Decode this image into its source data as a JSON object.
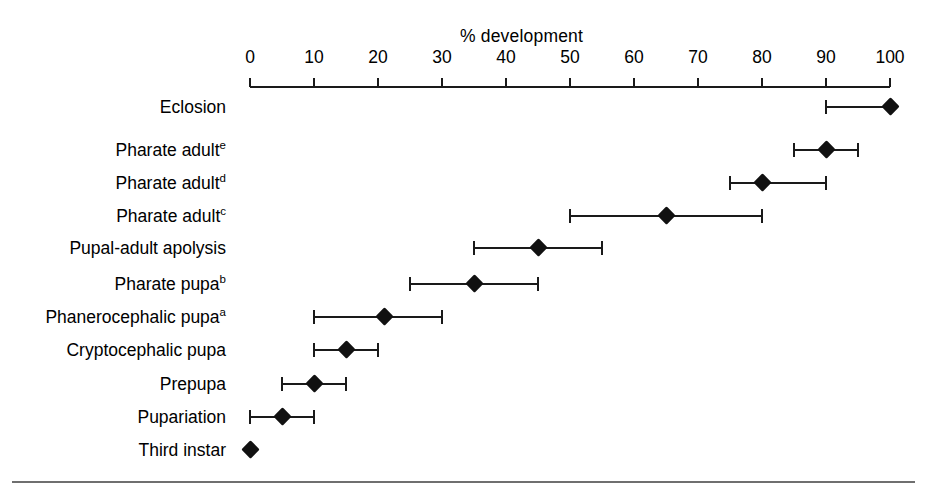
{
  "figure": {
    "background_color": "#ffffff",
    "marker_color": "#111111",
    "line_color": "#1a1a1a",
    "rule_color": "#6f6f6f"
  },
  "chart_data": {
    "type": "scatter",
    "title": "% development",
    "xlabel": "% development",
    "ylabel": "",
    "xlim": [
      0,
      100
    ],
    "xticks": [
      0,
      10,
      20,
      30,
      40,
      50,
      60,
      70,
      80,
      90,
      100
    ],
    "xticklabels": [
      "0",
      "10",
      "20",
      "30",
      "40",
      "50",
      "60",
      "70",
      "80",
      "90",
      "100"
    ],
    "grid": false,
    "legend": "none",
    "orientation": "horizontal",
    "error_bars": "horizontal range (min-max)",
    "categories": [
      "Eclosion",
      "Pharate adult e",
      "Pharate adult d",
      "Pharate adult c",
      "Pupal-adult apolysis",
      "Pharate pupa b",
      "Phanerocephalic pupa a",
      "Cryptocephalic pupa",
      "Prepupa",
      "Pupariation",
      "Third instar"
    ],
    "points": [
      {
        "label": "Eclosion",
        "label_text": "Eclosion",
        "superscript": "",
        "value": 100,
        "low": 90,
        "high": 100,
        "top": 96
      },
      {
        "label": "Pharate adult e",
        "label_text": "Pharate adult",
        "superscript": "e",
        "value": 90,
        "low": 85,
        "high": 95,
        "top": 139
      },
      {
        "label": "Pharate adult d",
        "label_text": "Pharate adult",
        "superscript": "d",
        "value": 80,
        "low": 75,
        "high": 90,
        "top": 172
      },
      {
        "label": "Pharate adult c",
        "label_text": "Pharate adult",
        "superscript": "c",
        "value": 65,
        "low": 50,
        "high": 80,
        "top": 205
      },
      {
        "label": "Pupal-adult apolysis",
        "label_text": "Pupal-adult apolysis",
        "superscript": "",
        "value": 45,
        "low": 35,
        "high": 55,
        "top": 237
      },
      {
        "label": "Pharate pupa b",
        "label_text": "Pharate pupa",
        "superscript": "b",
        "value": 35,
        "low": 25,
        "high": 45,
        "top": 273
      },
      {
        "label": "Phanerocephalic pupa a",
        "label_text": "Phanerocephalic pupa",
        "superscript": "a",
        "value": 21,
        "low": 10,
        "high": 30,
        "top": 306
      },
      {
        "label": "Cryptocephalic pupa",
        "label_text": "Cryptocephalic pupa",
        "superscript": "",
        "value": 15,
        "low": 10,
        "high": 20,
        "top": 339
      },
      {
        "label": "Prepupa",
        "label_text": "Prepupa",
        "superscript": "",
        "value": 10,
        "low": 5,
        "high": 15,
        "top": 373
      },
      {
        "label": "Pupariation",
        "label_text": "Pupariation",
        "superscript": "",
        "value": 5,
        "low": 0,
        "high": 10,
        "top": 406
      },
      {
        "label": "Third instar",
        "label_text": "Third instar",
        "superscript": "",
        "value": 0,
        "low": null,
        "high": null,
        "top": 439
      }
    ]
  }
}
